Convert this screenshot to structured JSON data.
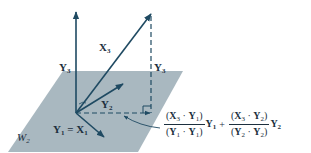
{
  "diagram": {
    "type": "vector-projection",
    "plane_label": "W",
    "plane_label_sub": "2",
    "colors": {
      "plane": "#a9b8c0",
      "vector": "#1f4a62",
      "text": "#1c2f3e",
      "background": "#ffffff"
    },
    "labels": {
      "y3_axis": {
        "base": "Y",
        "sub": "3"
      },
      "x3": {
        "base": "X",
        "sub": "3"
      },
      "y3_right": {
        "base": "Y",
        "sub": "3"
      },
      "y2": {
        "base": "Y",
        "sub": "2"
      },
      "y1_eq_x1": {
        "left_base": "Y",
        "left_sub": "1",
        "eq": "=",
        "right_base": "X",
        "right_sub": "1"
      }
    },
    "formula": {
      "term1": {
        "num": {
          "open": "(",
          "a": "X",
          "a_sub": "3",
          "dot": "·",
          "b": "Y",
          "b_sub": "1",
          "close": ")"
        },
        "den": {
          "open": "(",
          "a": "Y",
          "a_sub": "1",
          "dot": "·",
          "b": "Y",
          "b_sub": "1",
          "close": ")"
        },
        "vec": "Y",
        "vec_sub": "1"
      },
      "plus": "+",
      "term2": {
        "num": {
          "open": "(",
          "a": "X",
          "a_sub": "3",
          "dot": "·",
          "b": "Y",
          "b_sub": "2",
          "close": ")"
        },
        "den": {
          "open": "(",
          "a": "Y",
          "a_sub": "2",
          "dot": "·",
          "b": "Y",
          "b_sub": "2",
          "close": ")"
        },
        "vec": "Y",
        "vec_sub": "2"
      }
    }
  }
}
